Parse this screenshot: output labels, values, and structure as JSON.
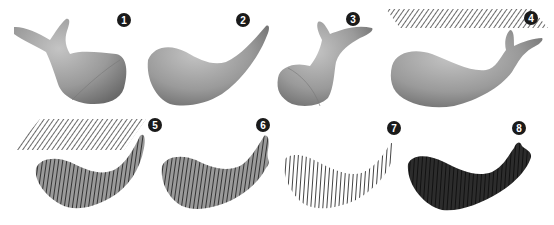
{
  "figure": {
    "colors": {
      "background": "#ffffff",
      "model_fill": "#9a9a9a",
      "model_dark": "#555555",
      "hatch_line": "#6a6a6a",
      "slice_fill": "#2c2c2c",
      "badge_fill": "#1a1a1a",
      "badge_text": "#ffffff"
    },
    "panels": [
      {
        "id": 1,
        "badge": "1",
        "content": "whale model, front view with tail up",
        "icon": "whale-model-icon"
      },
      {
        "id": 2,
        "badge": "2",
        "content": "whale model, side view curved",
        "icon": "whale-model-icon"
      },
      {
        "id": 3,
        "badge": "3",
        "content": "whale model, rear view with tail up",
        "icon": "whale-model-icon"
      },
      {
        "id": 4,
        "badge": "4",
        "content": "whale model with slicing plane above",
        "icon": "slicing-plane-icon"
      },
      {
        "id": 5,
        "badge": "5",
        "content": "slicing plane above model with slice lines",
        "icon": "slicing-plane-icon"
      },
      {
        "id": 6,
        "badge": "6",
        "content": "model with vertical slice lines",
        "icon": "sliced-model-icon"
      },
      {
        "id": 7,
        "badge": "7",
        "content": "outline contours of slices",
        "icon": "contour-outline-icon"
      },
      {
        "id": 8,
        "badge": "8",
        "content": "solid stacked slices",
        "icon": "stacked-slices-icon"
      }
    ]
  }
}
